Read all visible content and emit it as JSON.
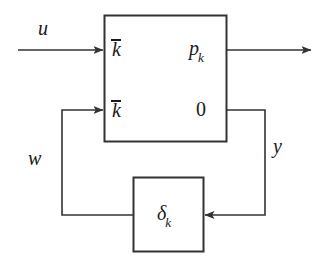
{
  "diagram": {
    "stroke_color": "#333333",
    "text_color": "#1a1a1a",
    "background": "#ffffff",
    "signals": {
      "input_label": "u",
      "output_label": "",
      "feedback_in_label": "w",
      "feedback_out_label": "y"
    },
    "main_block": {
      "name": "plant-block",
      "top_left_label": "k",
      "top_left_overbar": true,
      "top_right_label": "p",
      "top_right_subscript": "k",
      "bottom_left_label": "k",
      "bottom_left_overbar": true,
      "bottom_right_label": "0"
    },
    "delta_block": {
      "name": "uncertainty-block",
      "label": "δ",
      "subscript": "k"
    }
  }
}
